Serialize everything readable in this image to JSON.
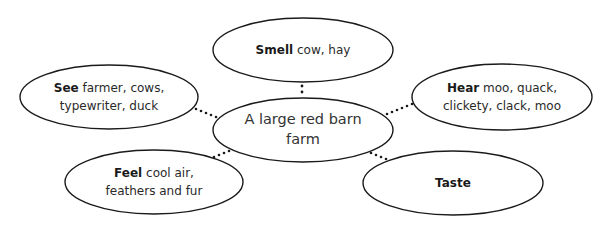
{
  "diagram": {
    "type": "senses-web",
    "center": {
      "text": "A large red barn farm",
      "line1": "A large red barn",
      "line2": "farm"
    },
    "nodes": [
      {
        "id": "smell",
        "label": "Smell",
        "detail_line1": "cow, hay",
        "detail_line2": ""
      },
      {
        "id": "see",
        "label": "See",
        "detail_line1": "farmer, cows,",
        "detail_line2": "typewriter, duck"
      },
      {
        "id": "hear",
        "label": "Hear",
        "detail_line1": "moo, quack,",
        "detail_line2": "clickety, clack, moo"
      },
      {
        "id": "feel",
        "label": "Feel",
        "detail_line1": "cool air,",
        "detail_line2": "feathers and fur"
      },
      {
        "id": "taste",
        "label": "Taste",
        "detail_line1": "",
        "detail_line2": ""
      }
    ],
    "colors": {
      "stroke": "#1a1a1a",
      "background": "#ffffff",
      "text": "#2a2a2a"
    }
  }
}
